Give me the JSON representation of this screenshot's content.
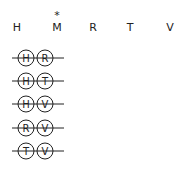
{
  "header": {
    "letters": [
      "H",
      "M",
      "R",
      "T",
      "V"
    ],
    "marked_index": 1,
    "marker": "*"
  },
  "pairs": [
    {
      "left": "H",
      "right": "R"
    },
    {
      "left": "H",
      "right": "T"
    },
    {
      "left": "H",
      "right": "V"
    },
    {
      "left": "R",
      "right": "V"
    },
    {
      "left": "T",
      "right": "V"
    }
  ],
  "colors": {
    "stroke": "#222222",
    "background": "#ffffff"
  }
}
